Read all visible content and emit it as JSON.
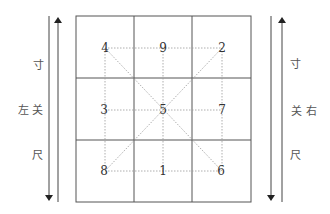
{
  "diagram": {
    "grid": {
      "rows": 3,
      "cols": 3,
      "numbers": [
        [
          "4",
          "9",
          "2"
        ],
        [
          "3",
          "5",
          "7"
        ],
        [
          "8",
          "1",
          "6"
        ]
      ]
    },
    "left_labels": {
      "cun": "寸",
      "guan_side": "左",
      "guan": "关",
      "chi": "尺"
    },
    "right_labels": {
      "cun": "寸",
      "guan": "关",
      "guan_side": "右",
      "chi": "尺"
    },
    "colors": {
      "grid_line": "#555555",
      "dotted_line": "#888888",
      "text": "#333333"
    }
  }
}
